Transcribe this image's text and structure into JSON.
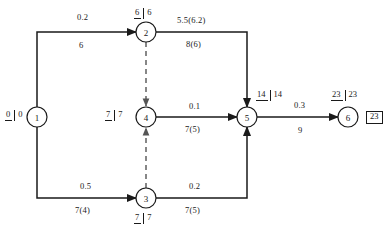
{
  "diagram": {
    "type": "project-network-diagram",
    "nodes": [
      {
        "id": "1",
        "label": "1",
        "time_pair": {
          "early": "0",
          "late": "0"
        },
        "cx": 37,
        "cy": 117
      },
      {
        "id": "2",
        "label": "2",
        "time_pair": {
          "early": "6",
          "late": "6"
        },
        "cx": 146,
        "cy": 32
      },
      {
        "id": "3",
        "label": "3",
        "time_pair": {
          "early": "7",
          "late": "7"
        },
        "cx": 146,
        "cy": 198
      },
      {
        "id": "4",
        "label": "4",
        "time_pair": {
          "early": "7",
          "late": "7"
        },
        "cx": 146,
        "cy": 117
      },
      {
        "id": "5",
        "label": "5",
        "time_pair": {
          "early": "14",
          "late": "14"
        },
        "cx": 247,
        "cy": 117
      },
      {
        "id": "6",
        "label": "6",
        "time_pair": {
          "early": "23",
          "late": "23"
        },
        "cx": 348,
        "cy": 117
      }
    ],
    "node_box_label": "23",
    "edges": [
      {
        "from": "1",
        "to": "2",
        "upper": "0.2",
        "lower": "6",
        "style": "solid"
      },
      {
        "from": "2",
        "to": "5",
        "upper": "5.5(6.2)",
        "lower": "8(6)",
        "style": "solid"
      },
      {
        "from": "4",
        "to": "5",
        "upper": "0.1",
        "lower": "7(5)",
        "style": "solid"
      },
      {
        "from": "5",
        "to": "6",
        "upper": "0.3",
        "lower": "9",
        "style": "solid"
      },
      {
        "from": "1",
        "to": "3",
        "upper": "0.5",
        "lower": "7(4)",
        "style": "solid"
      },
      {
        "from": "3",
        "to": "5",
        "upper": "0.2",
        "lower": "7(5)",
        "style": "solid"
      },
      {
        "from": "2",
        "to": "4",
        "upper": "",
        "lower": "",
        "style": "dashed"
      },
      {
        "from": "3",
        "to": "4",
        "upper": "",
        "lower": "",
        "style": "dashed"
      }
    ],
    "labels": {
      "edge_1_2_upper": "0.2",
      "edge_1_2_lower": "6",
      "edge_2_5_upper": "5.5(6.2)",
      "edge_2_5_lower": "8(6)",
      "edge_4_5_upper": "0.1",
      "edge_4_5_lower": "7(5)",
      "edge_5_6_upper": "0.3",
      "edge_5_6_lower": "9",
      "edge_1_3_upper": "0.5",
      "edge_1_3_lower": "7(4)",
      "edge_3_5_upper": "0.2",
      "edge_3_5_lower": "7(5)"
    },
    "colors": {
      "line": "#1a1a1a",
      "dashed_line": "#555555",
      "background": "#ffffff"
    }
  }
}
